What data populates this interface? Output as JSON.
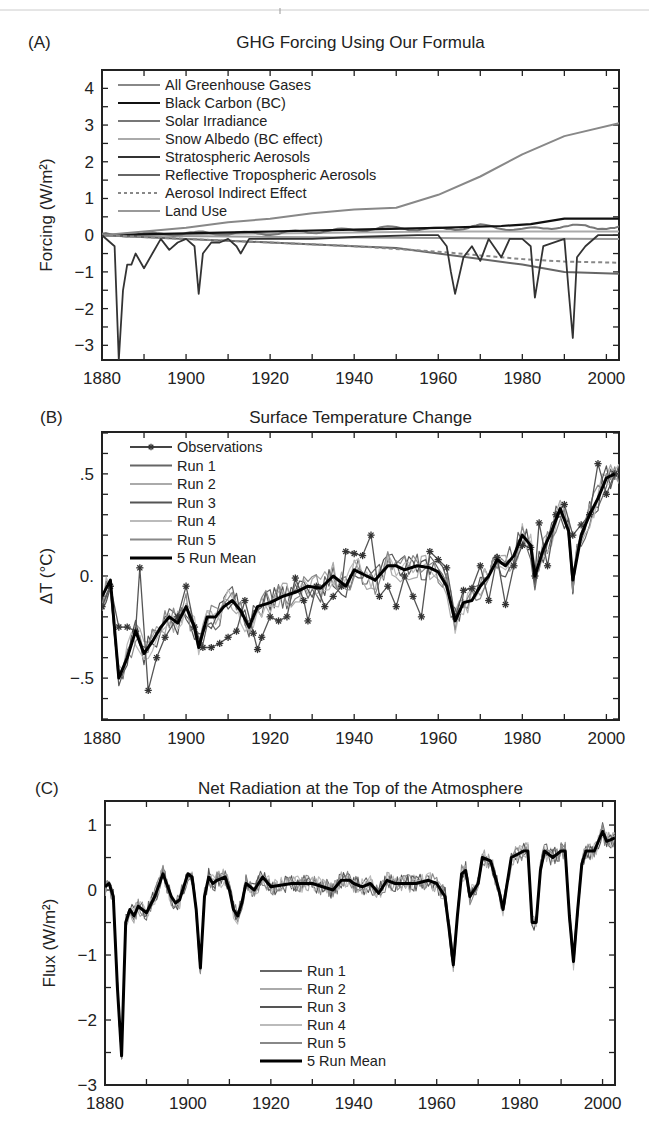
{
  "chart_data": [
    {
      "panel": "(A)",
      "type": "line",
      "title": "GHG Forcing Using Our Formula",
      "xlabel": "",
      "ylabel": "Forcing (W/m²)",
      "xlim": [
        1880,
        2003
      ],
      "ylim": [
        -3.4,
        4.5
      ],
      "xticks": [
        1880,
        1900,
        1920,
        1940,
        1960,
        1980,
        2000
      ],
      "yticks": [
        4,
        3,
        2,
        1,
        0,
        -1,
        -2,
        -3
      ],
      "legend_position": "upper left",
      "series": [
        {
          "name": "All Greenhouse Gases",
          "color": "#888888",
          "style": "solid",
          "x": [
            1880,
            1890,
            1900,
            1910,
            1920,
            1930,
            1940,
            1950,
            1960,
            1970,
            1980,
            1990,
            2003
          ],
          "y": [
            0.0,
            0.1,
            0.2,
            0.35,
            0.45,
            0.6,
            0.7,
            0.75,
            1.1,
            1.6,
            2.2,
            2.7,
            3.05
          ]
        },
        {
          "name": "Black Carbon (BC)",
          "color": "#111111",
          "style": "solid",
          "x": [
            1880,
            1900,
            1920,
            1940,
            1960,
            1975,
            1982,
            1990,
            2003
          ],
          "y": [
            0.0,
            0.05,
            0.1,
            0.15,
            0.2,
            0.25,
            0.3,
            0.45,
            0.45
          ]
        },
        {
          "name": "Solar Irradiance",
          "color": "#777777",
          "style": "solid",
          "x": [
            1880,
            1900,
            1920,
            1940,
            1950,
            1960,
            1970,
            1980,
            1990,
            2003
          ],
          "y": [
            0.0,
            0.05,
            0.05,
            0.15,
            0.2,
            0.15,
            0.25,
            0.15,
            0.25,
            0.2
          ]
        },
        {
          "name": "Snow Albedo (BC effect)",
          "color": "#aaaaaa",
          "style": "solid",
          "x": [
            1880,
            1920,
            1960,
            2003
          ],
          "y": [
            0.0,
            0.05,
            0.1,
            0.1
          ]
        },
        {
          "name": "Stratospheric Aerosols",
          "color": "#333333",
          "style": "solid",
          "x": [
            1880,
            1883,
            1884,
            1885,
            1886,
            1887,
            1888,
            1890,
            1892,
            1894,
            1896,
            1898,
            1900,
            1902,
            1903,
            1904,
            1906,
            1908,
            1910,
            1912,
            1913,
            1915,
            1920,
            1930,
            1940,
            1955,
            1960,
            1962,
            1963,
            1964,
            1966,
            1968,
            1970,
            1972,
            1975,
            1977,
            1980,
            1982,
            1983,
            1985,
            1990,
            1991,
            1992,
            1993,
            1995,
            1998,
            2003
          ],
          "y": [
            0,
            -0.3,
            -3.4,
            -1.5,
            -0.8,
            -0.8,
            -0.5,
            -0.9,
            -0.5,
            -0.1,
            -0.4,
            -0.2,
            -0.1,
            -0.3,
            -1.6,
            -0.5,
            -0.2,
            -0.2,
            -0.1,
            -0.3,
            -0.5,
            -0.1,
            -0.1,
            -0.1,
            -0.05,
            0.0,
            0.0,
            -0.3,
            -1.0,
            -1.6,
            -0.6,
            -0.3,
            -0.7,
            -0.1,
            -0.6,
            -0.1,
            -0.1,
            -0.3,
            -1.7,
            -0.3,
            -0.1,
            -1.5,
            -2.8,
            -0.6,
            -0.3,
            0.0,
            0.0
          ]
        },
        {
          "name": "Reflective Tropospheric Aerosols",
          "color": "#666666",
          "style": "solid",
          "x": [
            1880,
            1900,
            1920,
            1940,
            1950,
            1960,
            1970,
            1980,
            1990,
            2003
          ],
          "y": [
            0.0,
            -0.1,
            -0.2,
            -0.3,
            -0.35,
            -0.5,
            -0.65,
            -0.8,
            -1.0,
            -1.05
          ]
        },
        {
          "name": "Aerosol Indirect Effect",
          "color": "#888888",
          "style": "dashed",
          "x": [
            1880,
            1900,
            1920,
            1940,
            1960,
            1970,
            1980,
            1990,
            2003
          ],
          "y": [
            0.0,
            -0.1,
            -0.2,
            -0.3,
            -0.45,
            -0.55,
            -0.65,
            -0.72,
            -0.75
          ]
        },
        {
          "name": "Land Use",
          "color": "#999999",
          "style": "solid",
          "x": [
            1880,
            1920,
            1960,
            2003
          ],
          "y": [
            0.0,
            -0.05,
            -0.08,
            -0.1
          ]
        }
      ]
    },
    {
      "panel": "(B)",
      "type": "line",
      "title": "Surface Temperature Change",
      "xlabel": "",
      "ylabel": "ΔT (°C)",
      "xlim": [
        1880,
        2003
      ],
      "ylim": [
        -0.7,
        0.65
      ],
      "xticks": [
        1880,
        1900,
        1920,
        1940,
        1960,
        1980,
        2000
      ],
      "yticks": [
        ".5",
        "0.",
        "-.5"
      ],
      "ytick_values": [
        0.5,
        0.0,
        -0.5
      ],
      "legend_position": "upper left",
      "series": [
        {
          "name": "Observations",
          "color": "#444444",
          "style": "solid-star",
          "x": [
            1880,
            1882,
            1884,
            1886,
            1888,
            1889,
            1891,
            1893,
            1895,
            1898,
            1900,
            1902,
            1904,
            1906,
            1908,
            1910,
            1912,
            1914,
            1916,
            1917,
            1918,
            1920,
            1922,
            1924,
            1926,
            1928,
            1929,
            1931,
            1933,
            1935,
            1937,
            1938,
            1940,
            1942,
            1944,
            1946,
            1948,
            1950,
            1952,
            1954,
            1956,
            1958,
            1960,
            1962,
            1964,
            1966,
            1968,
            1970,
            1972,
            1974,
            1976,
            1978,
            1980,
            1982,
            1983,
            1984,
            1986,
            1988,
            1990,
            1992,
            1994,
            1996,
            1998,
            2000,
            2002
          ],
          "y": [
            -0.15,
            -0.05,
            -0.25,
            -0.25,
            -0.27,
            0.04,
            -0.56,
            -0.4,
            -0.3,
            -0.2,
            -0.05,
            -0.25,
            -0.35,
            -0.35,
            -0.33,
            -0.3,
            -0.27,
            -0.12,
            -0.28,
            -0.36,
            -0.3,
            -0.2,
            -0.22,
            -0.2,
            -0.01,
            -0.12,
            -0.22,
            -0.05,
            -0.15,
            -0.1,
            -0.05,
            0.12,
            0.11,
            0.1,
            0.2,
            -0.1,
            -0.05,
            -0.15,
            0.0,
            -0.1,
            -0.2,
            0.12,
            0.08,
            0.04,
            -0.2,
            -0.07,
            -0.06,
            0.05,
            -0.12,
            0.09,
            -0.14,
            0.05,
            0.15,
            0.14,
            0.0,
            0.26,
            0.05,
            0.3,
            0.35,
            0.2,
            0.25,
            0.3,
            0.55,
            0.4,
            0.5
          ]
        },
        {
          "name": "Run 1",
          "color": "#666666",
          "style": "solid"
        },
        {
          "name": "Run 2",
          "color": "#aaaaaa",
          "style": "solid"
        },
        {
          "name": "Run 3",
          "color": "#555555",
          "style": "solid"
        },
        {
          "name": "Run 4",
          "color": "#bbbbbb",
          "style": "solid"
        },
        {
          "name": "Run 5",
          "color": "#888888",
          "style": "solid"
        },
        {
          "name": "5 Run Mean",
          "color": "#000000",
          "style": "thick",
          "x": [
            1880,
            1882,
            1884,
            1886,
            1888,
            1890,
            1892,
            1894,
            1896,
            1898,
            1900,
            1902,
            1903,
            1905,
            1907,
            1909,
            1911,
            1913,
            1915,
            1917,
            1920,
            1923,
            1926,
            1929,
            1932,
            1935,
            1938,
            1940,
            1943,
            1945,
            1948,
            1950,
            1952,
            1955,
            1958,
            1960,
            1962,
            1964,
            1966,
            1968,
            1970,
            1972,
            1974,
            1976,
            1978,
            1980,
            1982,
            1983,
            1985,
            1987,
            1989,
            1991,
            1992,
            1994,
            1996,
            1998,
            2000,
            2002
          ],
          "y": [
            -0.1,
            -0.02,
            -0.5,
            -0.4,
            -0.27,
            -0.38,
            -0.32,
            -0.25,
            -0.2,
            -0.23,
            -0.15,
            -0.25,
            -0.35,
            -0.2,
            -0.2,
            -0.15,
            -0.12,
            -0.17,
            -0.25,
            -0.15,
            -0.13,
            -0.1,
            -0.08,
            -0.05,
            -0.06,
            0.0,
            -0.05,
            0.03,
            0.0,
            -0.02,
            0.05,
            0.05,
            0.03,
            0.05,
            0.04,
            0.02,
            -0.05,
            -0.22,
            -0.13,
            -0.12,
            -0.05,
            0.0,
            0.08,
            0.05,
            0.1,
            0.2,
            0.15,
            0.0,
            0.13,
            0.22,
            0.33,
            0.22,
            -0.02,
            0.2,
            0.3,
            0.38,
            0.48,
            0.5
          ]
        }
      ]
    },
    {
      "panel": "(C)",
      "type": "line",
      "title": "Net Radiation at the Top of the Atmosphere",
      "xlabel": "",
      "ylabel": "Flux (W/m²)",
      "xlim": [
        1880,
        2003
      ],
      "ylim": [
        -3,
        1.4
      ],
      "xticks": [
        1880,
        1900,
        1920,
        1940,
        1960,
        1980,
        2000
      ],
      "yticks": [
        1,
        0,
        -1,
        -2,
        -3
      ],
      "legend_position": "lower center",
      "series": [
        {
          "name": "Run 1",
          "color": "#666666",
          "style": "solid"
        },
        {
          "name": "Run 2",
          "color": "#aaaaaa",
          "style": "solid"
        },
        {
          "name": "Run 3",
          "color": "#555555",
          "style": "solid"
        },
        {
          "name": "Run 4",
          "color": "#bbbbbb",
          "style": "solid"
        },
        {
          "name": "Run 5",
          "color": "#888888",
          "style": "solid"
        },
        {
          "name": "5 Run Mean",
          "color": "#000000",
          "style": "thick",
          "x": [
            1880,
            1881,
            1882,
            1883,
            1884,
            1885,
            1886,
            1887,
            1888,
            1889,
            1890,
            1892,
            1894,
            1896,
            1897,
            1898,
            1900,
            1901,
            1902,
            1903,
            1904,
            1905,
            1906,
            1907,
            1909,
            1910,
            1911,
            1912,
            1913,
            1914,
            1916,
            1918,
            1920,
            1925,
            1930,
            1935,
            1937,
            1939,
            1940,
            1942,
            1944,
            1946,
            1948,
            1950,
            1955,
            1958,
            1960,
            1962,
            1963,
            1964,
            1965,
            1966,
            1967,
            1968,
            1970,
            1971,
            1973,
            1975,
            1976,
            1978,
            1981,
            1982,
            1983,
            1984,
            1985,
            1986,
            1988,
            1990,
            1991,
            1992,
            1993,
            1994,
            1995,
            1996,
            1998,
            2000,
            2001,
            2003
          ],
          "y": [
            0.05,
            0.1,
            -0.1,
            -1.5,
            -2.55,
            -0.5,
            -0.3,
            -0.4,
            -0.25,
            -0.3,
            -0.35,
            -0.1,
            0.25,
            -0.1,
            -0.2,
            -0.15,
            0.25,
            0.2,
            -0.3,
            -1.2,
            -0.1,
            0.2,
            0.1,
            0.15,
            0.2,
            0.0,
            -0.3,
            -0.4,
            -0.2,
            0.1,
            0.0,
            0.2,
            0.05,
            0.1,
            0.1,
            0.0,
            0.15,
            0.15,
            0.1,
            0.05,
            0.1,
            -0.05,
            0.15,
            0.1,
            0.1,
            0.15,
            0.1,
            -0.1,
            -0.6,
            -1.15,
            -0.4,
            0.25,
            0.3,
            -0.1,
            0.1,
            0.5,
            0.45,
            0.0,
            -0.3,
            0.5,
            0.6,
            0.6,
            -0.5,
            -0.5,
            0.3,
            0.6,
            0.5,
            0.6,
            0.6,
            -0.4,
            -1.1,
            -0.3,
            0.4,
            0.6,
            0.6,
            0.9,
            0.75,
            0.8
          ]
        }
      ]
    }
  ],
  "panels": {
    "a": {
      "label": "(A)",
      "title": "GHG Forcing Using Our Formula",
      "ylabel": "Forcing (W/m²)",
      "legend": [
        "All Greenhouse Gases",
        "Black Carbon (BC)",
        "Solar Irradiance",
        "Snow Albedo (BC effect)",
        "Stratospheric Aerosols",
        "Reflective Tropospheric Aerosols",
        "Aerosol Indirect Effect",
        "Land Use"
      ]
    },
    "b": {
      "label": "(B)",
      "title": "Surface Temperature Change",
      "ylabel": "ΔT (°C)",
      "legend": [
        "Observations",
        "Run 1",
        "Run 2",
        "Run 3",
        "Run 4",
        "Run 5",
        "5 Run Mean"
      ]
    },
    "c": {
      "label": "(C)",
      "title": "Net Radiation at the Top of the Atmosphere",
      "ylabel": "Flux (W/m²)",
      "legend": [
        "Run 1",
        "Run 2",
        "Run 3",
        "Run 4",
        "Run 5",
        "5 Run Mean"
      ]
    }
  }
}
